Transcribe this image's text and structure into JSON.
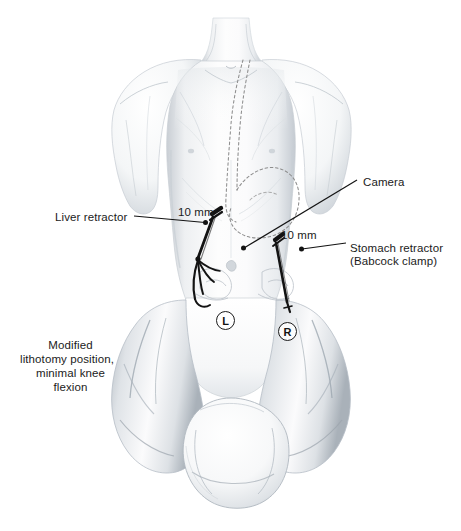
{
  "figure": {
    "background_color": "#ffffff",
    "width": 461,
    "height": 531,
    "ink_color": "#1b1b1b",
    "body_tone": "#e9ebee",
    "body_shadow": "#b9bfc6",
    "dashed_organ_color": "#8d8d8d"
  },
  "annotations": {
    "liver_retractor": {
      "text": "Liver retractor",
      "x": 55,
      "y": 210
    },
    "camera": {
      "text": "Camera",
      "x": 363,
      "y": 175
    },
    "stomach_retractor_line1": {
      "text": "Stomach retractor",
      "x": 350,
      "y": 241
    },
    "stomach_retractor_line2": {
      "text": "(Babcock clamp)",
      "x": 350,
      "y": 254
    },
    "trocar_size_left": {
      "text": "10 mm",
      "x": 178,
      "y": 205
    },
    "trocar_size_right": {
      "text": "10 mm",
      "x": 281,
      "y": 228
    },
    "position_note": {
      "line1": "Modified",
      "line2": "lithotomy position,",
      "line3": "minimal knee",
      "line4": "flexion",
      "x": 18,
      "y": 338
    }
  },
  "port_markers": [
    {
      "letter": "L",
      "x": 216,
      "y": 311
    },
    {
      "letter": "R",
      "x": 278,
      "y": 322
    }
  ],
  "leader_lines": [
    {
      "name": "liver-retractor-leader",
      "x1": 134,
      "y1": 216,
      "x2": 206,
      "y2": 223,
      "dot_at": "end"
    },
    {
      "name": "camera-leader",
      "x1": 357,
      "y1": 180,
      "x2": 243,
      "y2": 248,
      "dot_at": "end"
    },
    {
      "name": "stomach-retractor-leader",
      "x1": 346,
      "y1": 243,
      "x2": 301,
      "y2": 249,
      "dot_at": "end"
    }
  ],
  "instruments": [
    {
      "name": "liver-retractor-instrument",
      "type": "forked-retractor",
      "port": "left-upper-quadrant"
    },
    {
      "name": "babcock-clamp-instrument",
      "type": "straight-grasper",
      "port": "right-upper-quadrant"
    }
  ],
  "anatomy_overlay": {
    "esophagus_dashed": true,
    "stomach_dashed": true,
    "umbilicus": true,
    "nipples": 2
  }
}
